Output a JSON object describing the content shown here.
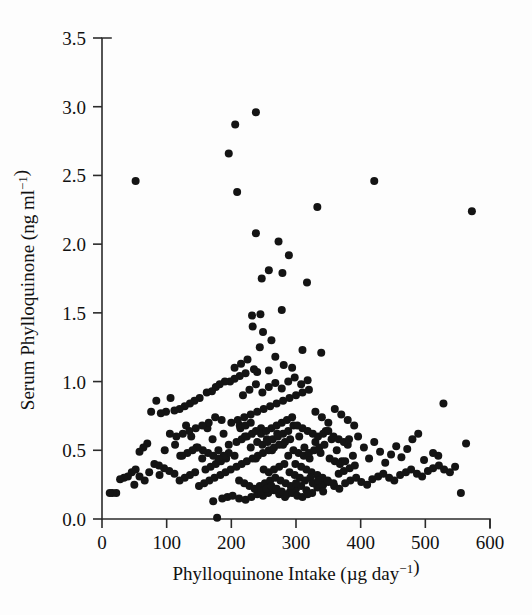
{
  "chart_data": {
    "type": "scatter",
    "title": "",
    "xlabel": "Phylloquinone Intake (µg day⁻¹)",
    "ylabel": "Serum Phylloquinone (ng ml⁻¹)",
    "xlim": [
      0,
      600
    ],
    "ylim": [
      0.0,
      3.5
    ],
    "xticks": [
      0,
      100,
      200,
      300,
      400,
      500,
      600
    ],
    "yticks": [
      0.0,
      0.5,
      1.0,
      1.5,
      2.0,
      2.5,
      3.0,
      3.5
    ],
    "xtick_labels": [
      "0",
      "100",
      "200",
      "300",
      "400",
      "500",
      "600"
    ],
    "ytick_labels": [
      "0.0",
      "0.5",
      "1.0",
      "1.5",
      "2.0",
      "2.5",
      "3.0",
      "3.5"
    ],
    "grid": false,
    "legend": null,
    "marker": "filled-circle",
    "marker_color": "#141414",
    "marker_size_px": 8,
    "n_points": 320,
    "points": [
      [
        52,
        2.46
      ],
      [
        421,
        2.46
      ],
      [
        572,
        2.24
      ],
      [
        238,
        2.96
      ],
      [
        206,
        2.87
      ],
      [
        196,
        2.66
      ],
      [
        209,
        2.38
      ],
      [
        238,
        2.08
      ],
      [
        258,
        1.81
      ],
      [
        247,
        1.75
      ],
      [
        279,
        1.79
      ],
      [
        289,
        1.92
      ],
      [
        273,
        2.02
      ],
      [
        333,
        2.27
      ],
      [
        317,
        1.72
      ],
      [
        278,
        1.52
      ],
      [
        245,
        1.49
      ],
      [
        232,
        1.48
      ],
      [
        233,
        1.4
      ],
      [
        249,
        1.36
      ],
      [
        262,
        1.3
      ],
      [
        244,
        1.25
      ],
      [
        310,
        1.23
      ],
      [
        339,
        1.21
      ],
      [
        268,
        1.18
      ],
      [
        281,
        1.12
      ],
      [
        294,
        1.1
      ],
      [
        258,
        1.08
      ],
      [
        240,
        1.07
      ],
      [
        222,
        1.06
      ],
      [
        213,
        1.04
      ],
      [
        205,
        1.02
      ],
      [
        198,
        1.0
      ],
      [
        190,
        1.0
      ],
      [
        182,
        0.98
      ],
      [
        176,
        0.96
      ],
      [
        170,
        0.93
      ],
      [
        162,
        0.92
      ],
      [
        151,
        0.88
      ],
      [
        143,
        0.86
      ],
      [
        136,
        0.84
      ],
      [
        128,
        0.82
      ],
      [
        120,
        0.8
      ],
      [
        112,
        0.79
      ],
      [
        106,
        0.88
      ],
      [
        99,
        0.78
      ],
      [
        91,
        0.77
      ],
      [
        84,
        0.86
      ],
      [
        76,
        0.78
      ],
      [
        70,
        0.55
      ],
      [
        64,
        0.52
      ],
      [
        58,
        0.49
      ],
      [
        52,
        0.36
      ],
      [
        46,
        0.34
      ],
      [
        40,
        0.31
      ],
      [
        34,
        0.3
      ],
      [
        28,
        0.29
      ],
      [
        22,
        0.19
      ],
      [
        16,
        0.19
      ],
      [
        12,
        0.19
      ],
      [
        178,
        0.01
      ],
      [
        172,
        0.13
      ],
      [
        186,
        0.15
      ],
      [
        194,
        0.16
      ],
      [
        202,
        0.17
      ],
      [
        212,
        0.15
      ],
      [
        222,
        0.14
      ],
      [
        231,
        0.16
      ],
      [
        240,
        0.18
      ],
      [
        249,
        0.17
      ],
      [
        257,
        0.19
      ],
      [
        266,
        0.21
      ],
      [
        274,
        0.18
      ],
      [
        283,
        0.16
      ],
      [
        291,
        0.2
      ],
      [
        300,
        0.22
      ],
      [
        308,
        0.24
      ],
      [
        316,
        0.21
      ],
      [
        325,
        0.19
      ],
      [
        333,
        0.23
      ],
      [
        342,
        0.25
      ],
      [
        350,
        0.27
      ],
      [
        359,
        0.24
      ],
      [
        367,
        0.22
      ],
      [
        376,
        0.26
      ],
      [
        384,
        0.28
      ],
      [
        393,
        0.3
      ],
      [
        401,
        0.27
      ],
      [
        410,
        0.25
      ],
      [
        418,
        0.29
      ],
      [
        427,
        0.31
      ],
      [
        435,
        0.33
      ],
      [
        444,
        0.3
      ],
      [
        452,
        0.28
      ],
      [
        461,
        0.32
      ],
      [
        470,
        0.34
      ],
      [
        478,
        0.36
      ],
      [
        487,
        0.33
      ],
      [
        495,
        0.31
      ],
      [
        504,
        0.35
      ],
      [
        512,
        0.37
      ],
      [
        521,
        0.39
      ],
      [
        529,
        0.36
      ],
      [
        538,
        0.34
      ],
      [
        546,
        0.38
      ],
      [
        555,
        0.19
      ],
      [
        563,
        0.55
      ],
      [
        528,
        0.84
      ],
      [
        520,
        0.46
      ],
      [
        512,
        0.48
      ],
      [
        498,
        0.43
      ],
      [
        489,
        0.62
      ],
      [
        480,
        0.58
      ],
      [
        472,
        0.51
      ],
      [
        463,
        0.45
      ],
      [
        455,
        0.53
      ],
      [
        447,
        0.47
      ],
      [
        438,
        0.41
      ],
      [
        430,
        0.49
      ],
      [
        421,
        0.56
      ],
      [
        413,
        0.44
      ],
      [
        405,
        0.52
      ],
      [
        396,
        0.6
      ],
      [
        388,
        0.46
      ],
      [
        380,
        0.54
      ],
      [
        371,
        0.42
      ],
      [
        363,
        0.5
      ],
      [
        355,
        0.58
      ],
      [
        346,
        0.64
      ],
      [
        338,
        0.48
      ],
      [
        330,
        0.56
      ],
      [
        321,
        0.44
      ],
      [
        313,
        0.52
      ],
      [
        305,
        0.6
      ],
      [
        296,
        0.68
      ],
      [
        288,
        0.46
      ],
      [
        280,
        0.54
      ],
      [
        271,
        0.62
      ],
      [
        263,
        0.5
      ],
      [
        255,
        0.58
      ],
      [
        246,
        0.66
      ],
      [
        238,
        0.44
      ],
      [
        230,
        0.52
      ],
      [
        221,
        0.6
      ],
      [
        213,
        0.68
      ],
      [
        205,
        0.46
      ],
      [
        196,
        0.54
      ],
      [
        188,
        0.62
      ],
      [
        180,
        0.5
      ],
      [
        171,
        0.58
      ],
      [
        163,
        0.66
      ],
      [
        155,
        0.44
      ],
      [
        146,
        0.52
      ],
      [
        138,
        0.6
      ],
      [
        130,
        0.68
      ],
      [
        121,
        0.46
      ],
      [
        113,
        0.54
      ],
      [
        105,
        0.62
      ],
      [
        97,
        0.5
      ],
      [
        89,
        0.32
      ],
      [
        81,
        0.4
      ],
      [
        73,
        0.34
      ],
      [
        66,
        0.28
      ],
      [
        58,
        0.31
      ],
      [
        50,
        0.25
      ],
      [
        150,
        0.24
      ],
      [
        158,
        0.26
      ],
      [
        166,
        0.28
      ],
      [
        174,
        0.3
      ],
      [
        183,
        0.32
      ],
      [
        191,
        0.34
      ],
      [
        199,
        0.36
      ],
      [
        208,
        0.38
      ],
      [
        216,
        0.4
      ],
      [
        224,
        0.42
      ],
      [
        233,
        0.44
      ],
      [
        241,
        0.46
      ],
      [
        249,
        0.48
      ],
      [
        258,
        0.5
      ],
      [
        266,
        0.52
      ],
      [
        274,
        0.54
      ],
      [
        283,
        0.56
      ],
      [
        291,
        0.58
      ],
      [
        299,
        0.4
      ],
      [
        308,
        0.38
      ],
      [
        316,
        0.36
      ],
      [
        324,
        0.34
      ],
      [
        333,
        0.32
      ],
      [
        341,
        0.3
      ],
      [
        349,
        0.28
      ],
      [
        358,
        0.26
      ],
      [
        366,
        0.33
      ],
      [
        374,
        0.35
      ],
      [
        383,
        0.37
      ],
      [
        391,
        0.39
      ],
      [
        200,
        0.7
      ],
      [
        210,
        0.72
      ],
      [
        220,
        0.74
      ],
      [
        230,
        0.76
      ],
      [
        240,
        0.78
      ],
      [
        250,
        0.8
      ],
      [
        260,
        0.82
      ],
      [
        270,
        0.84
      ],
      [
        280,
        0.86
      ],
      [
        290,
        0.88
      ],
      [
        300,
        0.9
      ],
      [
        310,
        0.92
      ],
      [
        320,
        0.94
      ],
      [
        330,
        0.78
      ],
      [
        340,
        0.74
      ],
      [
        350,
        0.7
      ],
      [
        360,
        0.8
      ],
      [
        370,
        0.76
      ],
      [
        380,
        0.72
      ],
      [
        390,
        0.68
      ],
      [
        185,
        0.72
      ],
      [
        175,
        0.74
      ],
      [
        165,
        0.7
      ],
      [
        155,
        0.68
      ],
      [
        145,
        0.66
      ],
      [
        135,
        0.64
      ],
      [
        125,
        0.62
      ],
      [
        115,
        0.6
      ],
      [
        218,
        0.9
      ],
      [
        228,
        0.94
      ],
      [
        238,
        0.98
      ],
      [
        248,
        0.92
      ],
      [
        258,
        0.96
      ],
      [
        268,
        0.99
      ],
      [
        278,
        0.95
      ],
      [
        288,
        1.0
      ],
      [
        298,
        1.03
      ],
      [
        308,
        0.98
      ],
      [
        318,
        1.01
      ],
      [
        205,
        1.1
      ],
      [
        215,
        1.13
      ],
      [
        225,
        1.16
      ],
      [
        235,
        1.09
      ],
      [
        212,
        0.28
      ],
      [
        220,
        0.26
      ],
      [
        228,
        0.24
      ],
      [
        236,
        0.22
      ],
      [
        244,
        0.24
      ],
      [
        252,
        0.26
      ],
      [
        260,
        0.28
      ],
      [
        268,
        0.3
      ],
      [
        276,
        0.28
      ],
      [
        284,
        0.26
      ],
      [
        292,
        0.24
      ],
      [
        300,
        0.26
      ],
      [
        160,
        0.36
      ],
      [
        168,
        0.38
      ],
      [
        176,
        0.4
      ],
      [
        184,
        0.42
      ],
      [
        192,
        0.44
      ],
      [
        144,
        0.34
      ],
      [
        136,
        0.32
      ],
      [
        128,
        0.3
      ],
      [
        120,
        0.28
      ],
      [
        112,
        0.33
      ],
      [
        104,
        0.35
      ],
      [
        96,
        0.37
      ],
      [
        88,
        0.39
      ],
      [
        208,
        0.56
      ],
      [
        216,
        0.58
      ],
      [
        224,
        0.6
      ],
      [
        232,
        0.62
      ],
      [
        240,
        0.56
      ],
      [
        248,
        0.54
      ],
      [
        256,
        0.56
      ],
      [
        264,
        0.58
      ],
      [
        272,
        0.6
      ],
      [
        280,
        0.62
      ],
      [
        288,
        0.64
      ],
      [
        296,
        0.5
      ],
      [
        304,
        0.48
      ],
      [
        312,
        0.46
      ],
      [
        320,
        0.48
      ],
      [
        328,
        0.5
      ],
      [
        336,
        0.52
      ],
      [
        344,
        0.54
      ],
      [
        352,
        0.44
      ],
      [
        360,
        0.42
      ],
      [
        368,
        0.4
      ],
      [
        376,
        0.42
      ],
      [
        196,
        0.48
      ],
      [
        188,
        0.46
      ],
      [
        180,
        0.44
      ],
      [
        172,
        0.46
      ],
      [
        164,
        0.48
      ],
      [
        156,
        0.5
      ],
      [
        148,
        0.52
      ],
      [
        140,
        0.5
      ],
      [
        132,
        0.48
      ],
      [
        124,
        0.46
      ],
      [
        250,
        0.36
      ],
      [
        258,
        0.34
      ],
      [
        266,
        0.36
      ],
      [
        274,
        0.38
      ],
      [
        282,
        0.4
      ],
      [
        290,
        0.34
      ],
      [
        298,
        0.32
      ],
      [
        306,
        0.3
      ],
      [
        314,
        0.28
      ],
      [
        322,
        0.3
      ],
      [
        246,
        0.2
      ],
      [
        254,
        0.22
      ],
      [
        262,
        0.24
      ],
      [
        270,
        0.22
      ],
      [
        278,
        0.2
      ],
      [
        286,
        0.18
      ],
      [
        294,
        0.19
      ],
      [
        302,
        0.17
      ],
      [
        310,
        0.16
      ],
      [
        318,
        0.18
      ],
      [
        326,
        0.26
      ],
      [
        334,
        0.28
      ],
      [
        342,
        0.2
      ],
      [
        214,
        0.66
      ],
      [
        222,
        0.68
      ],
      [
        230,
        0.7
      ],
      [
        238,
        0.64
      ],
      [
        246,
        0.62
      ],
      [
        254,
        0.64
      ],
      [
        262,
        0.66
      ],
      [
        270,
        0.68
      ],
      [
        278,
        0.7
      ],
      [
        286,
        0.72
      ],
      [
        294,
        0.74
      ],
      [
        302,
        0.68
      ],
      [
        310,
        0.66
      ],
      [
        318,
        0.64
      ],
      [
        326,
        0.62
      ],
      [
        334,
        0.6
      ],
      [
        342,
        0.62
      ],
      [
        350,
        0.64
      ],
      [
        358,
        0.6
      ],
      [
        366,
        0.58
      ],
      [
        374,
        0.56
      ],
      [
        382,
        0.58
      ]
    ]
  },
  "axes": {
    "x_axis_name": "x-axis",
    "y_axis_name": "y-axis"
  }
}
